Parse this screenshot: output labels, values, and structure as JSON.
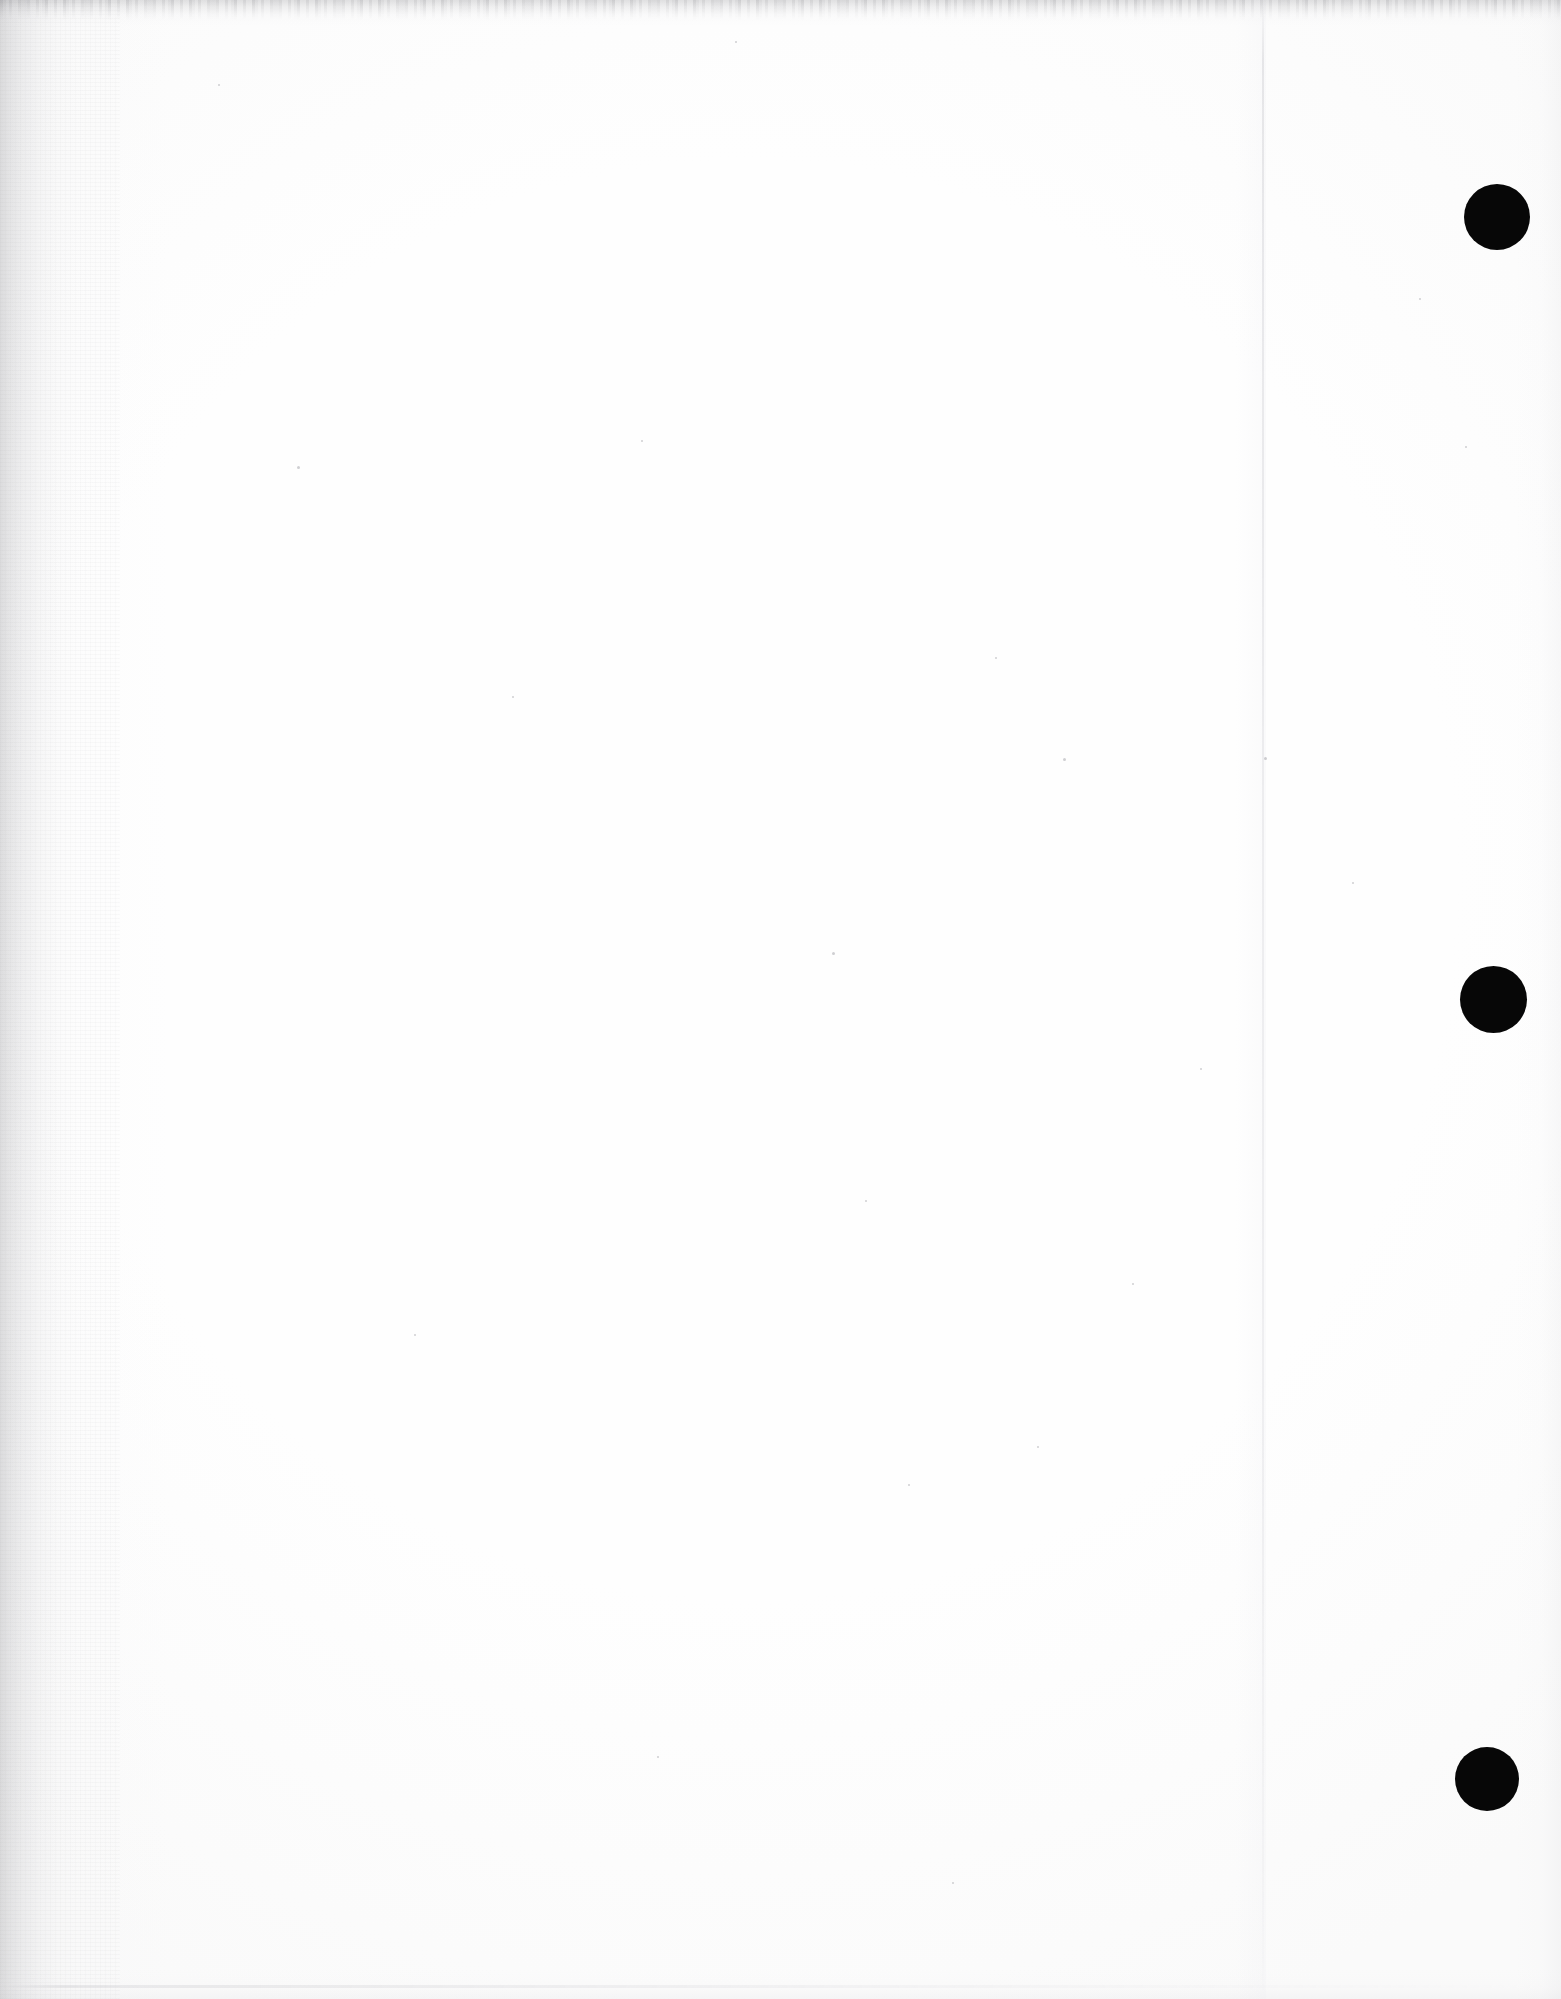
{
  "document": {
    "kind": "scanned-page",
    "page_state": "blank",
    "body_text": "",
    "width_px": 1561,
    "height_px": 1999
  },
  "colors": {
    "paper": "#fdfdfd",
    "paper_center": "#ffffff",
    "punch_mark": "#070707",
    "scan_edge_shadow": "#787880",
    "page_edge_line": "#d6d6da",
    "speck": "#787882"
  },
  "punch_holes": {
    "label": "three-hole-punch marks",
    "count": 3,
    "holes": [
      {
        "name": "top-punch-hole",
        "cx": 1497,
        "cy": 217,
        "d": 66
      },
      {
        "name": "middle-punch-hole",
        "cx": 1493,
        "cy": 999,
        "d": 67
      },
      {
        "name": "bottom-punch-hole",
        "cx": 1487,
        "cy": 1779,
        "d": 64
      }
    ]
  },
  "artifacts": {
    "left_edge_band": "dark noisy scanner edge along left margin",
    "top_edge_band": "gray noisy scanner edge along top margin",
    "bottom_edge_line": "faint gray scanner edge near bottom",
    "right_edge_band": "faint gray falloff along right margin",
    "page_edge_line": "faint vertical page-edge line at x=1262"
  },
  "specks": [
    {
      "x": 297,
      "y": 466,
      "s": 3
    },
    {
      "x": 512,
      "y": 696,
      "s": 2
    },
    {
      "x": 641,
      "y": 440,
      "s": 2
    },
    {
      "x": 735,
      "y": 41,
      "s": 2
    },
    {
      "x": 832,
      "y": 952,
      "s": 3
    },
    {
      "x": 865,
      "y": 1200,
      "s": 2
    },
    {
      "x": 908,
      "y": 1484,
      "s": 2
    },
    {
      "x": 952,
      "y": 1882,
      "s": 2
    },
    {
      "x": 995,
      "y": 657,
      "s": 2
    },
    {
      "x": 1037,
      "y": 1446,
      "s": 2
    },
    {
      "x": 1063,
      "y": 758,
      "s": 3
    },
    {
      "x": 1132,
      "y": 1283,
      "s": 2
    },
    {
      "x": 1200,
      "y": 1068,
      "s": 2
    },
    {
      "x": 1264,
      "y": 757,
      "s": 3
    },
    {
      "x": 1352,
      "y": 882,
      "s": 2
    },
    {
      "x": 1419,
      "y": 298,
      "s": 2
    },
    {
      "x": 1465,
      "y": 446,
      "s": 2
    },
    {
      "x": 218,
      "y": 84,
      "s": 2
    },
    {
      "x": 414,
      "y": 1334,
      "s": 2
    },
    {
      "x": 657,
      "y": 1756,
      "s": 2
    }
  ]
}
